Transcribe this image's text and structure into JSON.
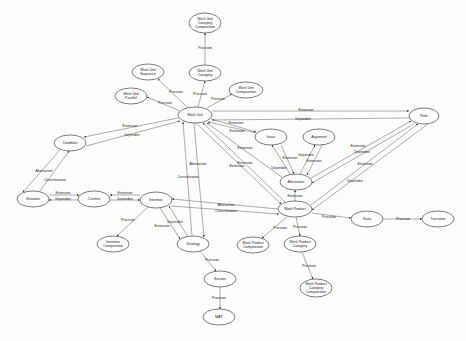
{
  "diagram": {
    "title": "",
    "nodes": [
      {
        "id": "wucc",
        "lines": [
          "Work Unit",
          "Category",
          "Composition"
        ],
        "x": 205,
        "y": 23,
        "rx": 16,
        "ry": 10
      },
      {
        "id": "wucat",
        "lines": [
          "Work Unit",
          "Category"
        ],
        "x": 205,
        "y": 73,
        "rx": 16,
        "ry": 8
      },
      {
        "id": "wuseq",
        "lines": [
          "Work Unit",
          "Sequence"
        ],
        "x": 148,
        "y": 72,
        "rx": 16,
        "ry": 8
      },
      {
        "id": "wupar",
        "lines": [
          "Work Unit",
          "Parallel"
        ],
        "x": 131,
        "y": 96,
        "rx": 16,
        "ry": 8
      },
      {
        "id": "wucomp",
        "lines": [
          "Work Unit",
          "Composition"
        ],
        "x": 246,
        "y": 90,
        "rx": 17,
        "ry": 8
      },
      {
        "id": "wu",
        "lines": [
          "Work Unit"
        ],
        "x": 195,
        "y": 115,
        "rx": 17,
        "ry": 8
      },
      {
        "id": "role",
        "lines": [
          "Role"
        ],
        "x": 424,
        "y": 116,
        "rx": 15,
        "ry": 8
      },
      {
        "id": "cond",
        "lines": [
          "Condition"
        ],
        "x": 70,
        "y": 143,
        "rx": 16,
        "ry": 8
      },
      {
        "id": "issue",
        "lines": [
          "Issue"
        ],
        "x": 271,
        "y": 137,
        "rx": 16,
        "ry": 8
      },
      {
        "id": "arg",
        "lines": [
          "Argument"
        ],
        "x": 319,
        "y": 137,
        "rx": 16,
        "ry": 8
      },
      {
        "id": "alt",
        "lines": [
          "Alternative"
        ],
        "x": 296,
        "y": 182,
        "rx": 16,
        "ry": 8
      },
      {
        "id": "sit",
        "lines": [
          "Situation"
        ],
        "x": 33,
        "y": 199,
        "rx": 16,
        "ry": 8
      },
      {
        "id": "ctx",
        "lines": [
          "Context"
        ],
        "x": 94,
        "y": 199,
        "rx": 16,
        "ry": 8
      },
      {
        "id": "int",
        "lines": [
          "Intention"
        ],
        "x": 156,
        "y": 200,
        "rx": 16,
        "ry": 8
      },
      {
        "id": "wp",
        "lines": [
          "Work Product"
        ],
        "x": 295,
        "y": 209,
        "rx": 17,
        "ry": 8
      },
      {
        "id": "state",
        "lines": [
          "State"
        ],
        "x": 367,
        "y": 219,
        "rx": 16,
        "ry": 8
      },
      {
        "id": "trans",
        "lines": [
          "Transition"
        ],
        "x": 438,
        "y": 219,
        "rx": 16,
        "ry": 8
      },
      {
        "id": "intcomp",
        "lines": [
          "Intention",
          "Composition"
        ],
        "x": 113,
        "y": 244,
        "rx": 16,
        "ry": 8
      },
      {
        "id": "strat",
        "lines": [
          "Strategy"
        ],
        "x": 193,
        "y": 244,
        "rx": 16,
        "ry": 8
      },
      {
        "id": "wpcomp",
        "lines": [
          "Work Product",
          "Composition"
        ],
        "x": 253,
        "y": 245,
        "rx": 16,
        "ry": 8
      },
      {
        "id": "wpcat",
        "lines": [
          "Work Product",
          "Category"
        ],
        "x": 300,
        "y": 244,
        "rx": 16,
        "ry": 8
      },
      {
        "id": "sect",
        "lines": [
          "Section"
        ],
        "x": 220,
        "y": 279,
        "rx": 16,
        "ry": 8
      },
      {
        "id": "wpcc",
        "lines": [
          "Work Product",
          "Category",
          "Composition"
        ],
        "x": 316,
        "y": 288,
        "rx": 16,
        "ry": 9
      },
      {
        "id": "map",
        "lines": [
          "MAP"
        ],
        "x": 219,
        "y": 317,
        "rx": 16,
        "ry": 8
      }
    ],
    "edges": [
      {
        "from": "wucat",
        "to": "wucc",
        "label": "Precision",
        "path": "M205,65 L205,33",
        "lx": 205,
        "ly": 48
      },
      {
        "from": "wu",
        "to": "wuseq",
        "label": "Precision",
        "path": "M188,108 L158,79",
        "lx": 176,
        "ly": 92
      },
      {
        "from": "wu",
        "to": "wucat",
        "label": "Precision",
        "path": "M198,107 L205,81",
        "lx": 200,
        "ly": 94
      },
      {
        "from": "wu",
        "to": "wupar",
        "label": "Precision",
        "path": "M180,111 L147,97",
        "lx": 165,
        "ly": 103
      },
      {
        "from": "wu",
        "to": "wucomp",
        "label": "Precision",
        "path": "M207,108 L232,94",
        "lx": 218,
        "ly": 99
      },
      {
        "from": "wu",
        "to": "role",
        "label": "Extension",
        "path": "M212,111 L409,111",
        "lx": 306,
        "ly": 110
      },
      {
        "from": "role",
        "to": "wu",
        "label": "Dependee",
        "path": "M409,118 L212,120",
        "lx": 303,
        "ly": 119
      },
      {
        "from": "wu",
        "to": "cond",
        "label": "Extension",
        "path": "M178,118 L84,137",
        "lx": 130,
        "ly": 126
      },
      {
        "from": "cond",
        "to": "wu",
        "label": "Dependee",
        "path": "M86,146 L180,121",
        "lx": 132,
        "ly": 135
      },
      {
        "from": "wu",
        "to": "issue",
        "label": "Extension",
        "path": "M211,119 L256,132",
        "lx": 236,
        "ly": 123
      },
      {
        "from": "issue",
        "to": "wu",
        "label": "Extension",
        "path": "M256,133 L208,122",
        "lx": 237,
        "ly": 131
      },
      {
        "from": "alt",
        "to": "wu",
        "label": "Extension",
        "path": "M283,178 L207,123",
        "lx": 245,
        "ly": 148
      },
      {
        "from": "wp",
        "to": "wu",
        "label": "Extension",
        "path": "M285,202 L203,123",
        "lx": 245,
        "ly": 163
      },
      {
        "from": "wu",
        "to": "wp",
        "label": "Extension",
        "path": "M196,123 L281,204",
        "lx": 237,
        "ly": 166
      },
      {
        "from": "alt",
        "to": "issue",
        "label": "Dependee",
        "path": "M290,174 L272,145",
        "lx": 279,
        "ly": 168
      },
      {
        "from": "issue",
        "to": "alt",
        "label": "Extension",
        "path": "M281,145 L294,174",
        "lx": 290,
        "ly": 158
      },
      {
        "from": "alt",
        "to": "arg",
        "label": "Dependee",
        "path": "M300,174 L315,145",
        "lx": 306,
        "ly": 155
      },
      {
        "from": "arg",
        "to": "alt",
        "label": "Extension",
        "path": "M322,145 L307,175",
        "lx": 314,
        "ly": 161
      },
      {
        "from": "alt",
        "to": "role",
        "label": "Extension",
        "path": "M311,178 L411,121",
        "lx": 358,
        "ly": 146
      },
      {
        "from": "role",
        "to": "alt",
        "label": "Dependee",
        "path": "M414,124 L312,183",
        "lx": 362,
        "ly": 152
      },
      {
        "from": "wp",
        "to": "role",
        "label": "Extension",
        "path": "M311,205 L418,124",
        "lx": 365,
        "ly": 164
      },
      {
        "from": "role",
        "to": "wp",
        "label": "Dependee",
        "path": "M428,124 L312,210",
        "lx": 355,
        "ly": 181
      },
      {
        "from": "wp",
        "to": "alt",
        "label": "Extension",
        "path": "M295,201 L295,190",
        "lx": 295,
        "ly": 196
      },
      {
        "from": "cond",
        "to": "sit",
        "label": "Abstraction",
        "path": "M60,150 L23,192",
        "lx": 44,
        "ly": 171
      },
      {
        "from": "sit",
        "to": "cond",
        "label": "Concretization",
        "path": "M40,191 L69,151",
        "lx": 55,
        "ly": 180
      },
      {
        "from": "sit",
        "to": "ctx",
        "label": "Extension",
        "path": "M49,195 L79,195",
        "lx": 63,
        "ly": 193
      },
      {
        "from": "ctx",
        "to": "sit",
        "label": "Dependee",
        "path": "M79,200 L49,200",
        "lx": 63,
        "ly": 199
      },
      {
        "from": "int",
        "to": "ctx",
        "label": "Extension",
        "path": "M140,195 L110,195",
        "lx": 125,
        "ly": 193
      },
      {
        "from": "ctx",
        "to": "int",
        "label": "Dependee",
        "path": "M110,200 L140,200",
        "lx": 125,
        "ly": 199
      },
      {
        "from": "wp",
        "to": "int",
        "label": "Abstraction",
        "path": "M278,209 L172,199",
        "lx": 226,
        "ly": 205
      },
      {
        "from": "int",
        "to": "wp",
        "label": "Concretization",
        "path": "M171,206 L279,214",
        "lx": 226,
        "ly": 211
      },
      {
        "from": "strat",
        "to": "wu",
        "label": "Abstraction",
        "path": "M192,236 L183,122",
        "lx": 198,
        "ly": 164
      },
      {
        "from": "wu",
        "to": "strat",
        "label": "Concretization",
        "path": "M194,123 L204,237",
        "lx": 188,
        "ly": 177
      },
      {
        "from": "int",
        "to": "intcomp",
        "label": "Precision",
        "path": "M148,207 L117,236",
        "lx": 128,
        "ly": 220
      },
      {
        "from": "strat",
        "to": "int",
        "label": "Dependee",
        "path": "M188,237 L169,206",
        "lx": 175,
        "ly": 222
      },
      {
        "from": "int",
        "to": "strat",
        "label": "Extension",
        "path": "M160,208 L180,239",
        "lx": 162,
        "ly": 226
      },
      {
        "from": "strat",
        "to": "sect",
        "label": "Precision",
        "path": "M200,251 L216,271",
        "lx": 212,
        "ly": 260
      },
      {
        "from": "sect",
        "to": "map",
        "label": "Precision",
        "path": "M220,287 L220,309",
        "lx": 219,
        "ly": 298
      },
      {
        "from": "wp",
        "to": "state",
        "label": "Precision",
        "path": "M312,213 L351,218",
        "lx": 329,
        "ly": 217
      },
      {
        "from": "state",
        "to": "trans",
        "label": "Precision",
        "path": "M383,219 L422,219",
        "lx": 403,
        "ly": 219
      },
      {
        "from": "wp",
        "to": "wpcomp",
        "label": "Precision",
        "path": "M287,217 L262,238",
        "lx": 280,
        "ly": 228
      },
      {
        "from": "wp",
        "to": "wpcat",
        "label": "Precision",
        "path": "M296,217 L300,236",
        "lx": 300,
        "ly": 227
      },
      {
        "from": "wpcat",
        "to": "wpcc",
        "label": "Precision",
        "path": "M302,252 L313,279",
        "lx": 309,
        "ly": 266
      }
    ]
  }
}
